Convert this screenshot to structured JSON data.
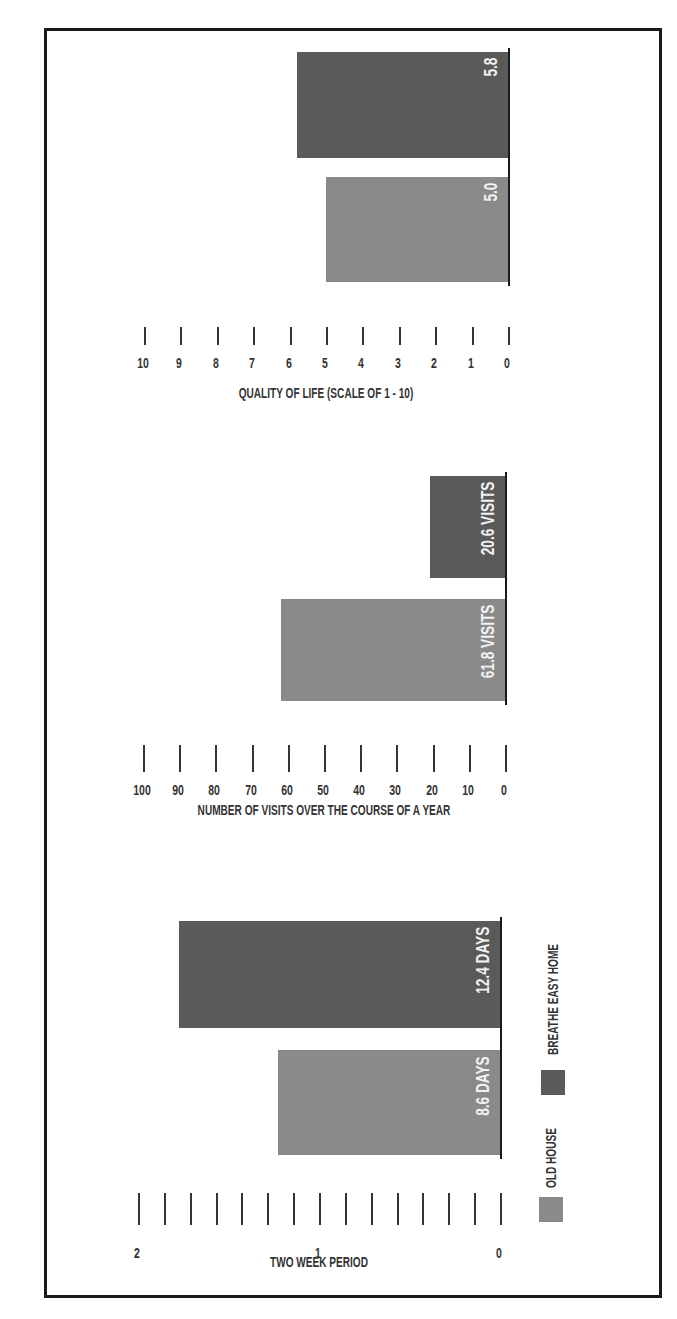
{
  "colors": {
    "old_house": "#8a8a8a",
    "breathe_easy_home": "#5a5a5a",
    "frame": "#1a1a1a",
    "bar_label": "#f2f2f2"
  },
  "legend": {
    "items": [
      {
        "label": "OLD HOUSE",
        "color": "#8a8a8a"
      },
      {
        "label": "BREATHE EASY HOME",
        "color": "#5a5a5a"
      }
    ]
  },
  "chart_data": [
    {
      "type": "bar",
      "orientation": "vertical",
      "title": "",
      "xlabel": "",
      "ylabel": "TWO WEEK PERIOD",
      "categories": [
        "OLD HOUSE",
        "BREATHE EASY HOME"
      ],
      "values": [
        8.6,
        12.4
      ],
      "value_unit": "days",
      "value_labels": [
        "8.6 DAYS",
        "12.4 DAYS"
      ],
      "ylim": [
        0,
        14
      ],
      "axis_ticks": [
        "0",
        "1",
        "2"
      ],
      "axis_tick_note": "axis labelled in two-week periods (0, 1, 2); minor ticks every 1 day, 14 days total",
      "data_note": "8.6 DAYS bar is drawn shorter in the source image than its axis implies (reads ~7.7 days); labelled value retained",
      "grid": false,
      "legend_position": "bottom"
    },
    {
      "type": "bar",
      "orientation": "vertical",
      "title": "",
      "xlabel": "",
      "ylabel": "NUMBER OF VISITS OVER THE COURSE OF A YEAR",
      "categories": [
        "OLD HOUSE",
        "BREATHE EASY HOME"
      ],
      "values": [
        61.8,
        20.6
      ],
      "value_labels": [
        "61.8 VISITS",
        "20.6 VISITS"
      ],
      "ylim": [
        0,
        100
      ],
      "axis_ticks": [
        "0",
        "10",
        "20",
        "30",
        "40",
        "50",
        "60",
        "70",
        "80",
        "90",
        "100"
      ],
      "grid": false
    },
    {
      "type": "bar",
      "orientation": "vertical",
      "title": "",
      "xlabel": "",
      "ylabel": "QUALITY OF LIFE (SCALE OF 1 - 10)",
      "categories": [
        "OLD HOUSE",
        "BREATHE EASY HOME"
      ],
      "values": [
        5.0,
        5.8
      ],
      "value_labels": [
        "5.0",
        "5.8"
      ],
      "ylim": [
        0,
        10
      ],
      "axis_ticks": [
        "0",
        "1",
        "2",
        "3",
        "4",
        "5",
        "6",
        "7",
        "8",
        "9",
        "10"
      ],
      "grid": false
    }
  ]
}
